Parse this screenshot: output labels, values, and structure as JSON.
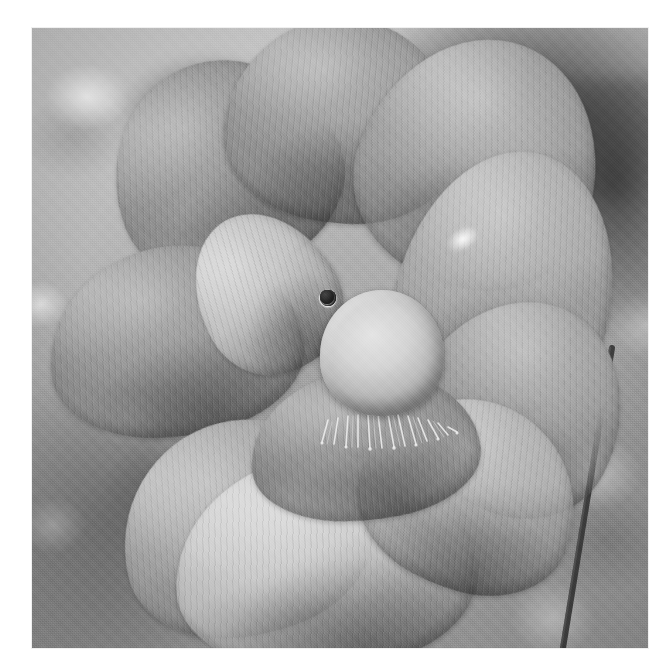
{
  "image": {
    "subject": "lotus-flower",
    "title": "Lotus flower in bloom with seed pod",
    "medium": "black-and-white photograph",
    "color_mode": "grayscale",
    "canvas": {
      "width": 670,
      "height": 669,
      "background": "#ffffff"
    },
    "print_area": {
      "x": 32,
      "y": 28,
      "width": 616,
      "height": 620
    },
    "palette": {
      "paper_white": "#ffffff",
      "gravel_light": "#cfcfcf",
      "gravel_mid": "#a9a9a9",
      "shadow_dark": "#262626",
      "petal_light": "#cdcdcd",
      "petal_mid": "#9e9e9e",
      "petal_dark": "#6e6e6e",
      "pod_highlight": "#e6e2d6",
      "pod_shadow": "#9d9a90",
      "carpel_dark": "#1b1b18",
      "stamen_bright": "#ededed"
    }
  },
  "scene": {
    "background_label": "blurred gravel ground",
    "foreground_label": "open lotus blossom",
    "elements": [
      {
        "name": "seed-pod",
        "label": "lotus seed pod (receptacle)"
      },
      {
        "name": "stamen-ring",
        "label": "ring of stamen filaments"
      },
      {
        "name": "petals",
        "label": "overlapping lotus petals"
      },
      {
        "name": "stem",
        "label": "thin dark stem crossing the right side"
      },
      {
        "name": "leaf-shadow",
        "label": "dark out-of-focus leaf mass"
      }
    ]
  },
  "seed_pod": {
    "label": "seed pod",
    "center": {
      "x": 350,
      "y": 325
    },
    "radius": 62,
    "carpel_count": 13,
    "carpels": [
      {
        "x": 328,
        "y": 287,
        "r": 7
      },
      {
        "x": 374,
        "y": 285,
        "r": 8
      },
      {
        "x": 307,
        "y": 312,
        "r": 7
      },
      {
        "x": 350,
        "y": 311,
        "r": 7
      },
      {
        "x": 392,
        "y": 309,
        "r": 8
      },
      {
        "x": 297,
        "y": 341,
        "r": 8
      },
      {
        "x": 336,
        "y": 337,
        "r": 7
      },
      {
        "x": 375,
        "y": 337,
        "r": 7
      },
      {
        "x": 307,
        "y": 369,
        "r": 8
      },
      {
        "x": 347,
        "y": 366,
        "r": 7
      },
      {
        "x": 388,
        "y": 365,
        "r": 8
      },
      {
        "x": 330,
        "y": 389,
        "r": 7
      },
      {
        "x": 372,
        "y": 388,
        "r": 7
      }
    ]
  },
  "petals": [
    {
      "name": "petal-upper-left",
      "label": "upper left petal",
      "x": 110,
      "y": 60,
      "w": 230,
      "h": 215,
      "rot": -22,
      "tone": "#8d8d8d",
      "vein_angle": "110deg"
    },
    {
      "name": "petal-top-center",
      "label": "top centre petal",
      "x": 225,
      "y": 18,
      "w": 235,
      "h": 205,
      "rot": 6,
      "tone": "#949494",
      "vein_angle": "88deg"
    },
    {
      "name": "petal-upper-right",
      "label": "upper right petal",
      "x": 360,
      "y": 38,
      "w": 240,
      "h": 250,
      "rot": 20,
      "tone": "#9e9e9e",
      "vein_angle": "70deg"
    },
    {
      "name": "petal-left-outer",
      "label": "left outer petal",
      "x": 48,
      "y": 246,
      "w": 255,
      "h": 190,
      "rot": -8,
      "tone": "#8f8f8f",
      "vein_angle": "96deg"
    },
    {
      "name": "petal-left-inner",
      "label": "left inner petal",
      "x": 196,
      "y": 210,
      "w": 140,
      "h": 165,
      "rot": -30,
      "tone": "#c0c0c0",
      "vein_angle": "104deg"
    },
    {
      "name": "petal-right-outer",
      "label": "right outer petal",
      "x": 400,
      "y": 150,
      "w": 215,
      "h": 265,
      "rot": 14,
      "tone": "#a6a6a6",
      "vein_angle": "78deg"
    },
    {
      "name": "petal-right-mid",
      "label": "right middle petal",
      "x": 415,
      "y": 300,
      "w": 210,
      "h": 215,
      "rot": 28,
      "tone": "#989898",
      "vein_angle": "62deg"
    },
    {
      "name": "petal-bottom-left",
      "label": "bottom left petal",
      "x": 120,
      "y": 420,
      "w": 250,
      "h": 215,
      "rot": -14,
      "tone": "#a2a2a2",
      "vein_angle": "100deg"
    },
    {
      "name": "petal-bottom-main",
      "label": "large bottom petal",
      "x": 175,
      "y": 455,
      "w": 300,
      "h": 215,
      "rot": -4,
      "tone": "#c4c4c4",
      "vein_angle": "94deg"
    },
    {
      "name": "petal-bottom-right",
      "label": "bottom right petal",
      "x": 360,
      "y": 400,
      "w": 220,
      "h": 190,
      "rot": 22,
      "tone": "#ababab",
      "vein_angle": "74deg"
    },
    {
      "name": "petal-center-front",
      "label": "front centre petal",
      "x": 250,
      "y": 370,
      "w": 230,
      "h": 150,
      "rot": -6,
      "tone": "#8a8a8a",
      "vein_angle": "92deg"
    }
  ],
  "stem": {
    "label": "flower stem",
    "from": {
      "x": 612,
      "y": 348
    },
    "to": {
      "x": 563,
      "y": 648
    },
    "width": 6,
    "color": "#3a3a3a"
  },
  "highlights": [
    {
      "name": "highlight-petal-edge",
      "x": 448,
      "y": 214,
      "w": 34,
      "h": 22,
      "rot": -32
    },
    {
      "name": "highlight-pod-rim",
      "x": 300,
      "y": 268,
      "w": 40,
      "h": 16,
      "rot": -18
    }
  ]
}
